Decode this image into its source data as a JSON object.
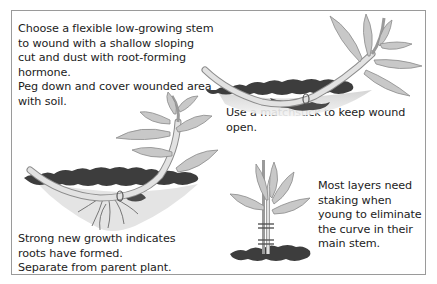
{
  "figure": {
    "steps": [
      {
        "id": "step-1",
        "lines": [
          "Choose a flexible low-growing stem",
          "to wound with a shallow sloping",
          "cut and dust with root-forming",
          "hormone.",
          "Peg down and cover wounded area",
          "with soil."
        ],
        "illustration": "stem-pegged-in-soil"
      },
      {
        "id": "step-2",
        "lines": [
          "Use a matchstick to keep wound",
          "open."
        ],
        "illustration": "wounded-stem-with-matchstick"
      },
      {
        "id": "step-3",
        "lines": [
          "Strong new growth indicates",
          "roots have formed.",
          "Separate from parent plant."
        ],
        "illustration": "rooted-layer-with-new-growth"
      },
      {
        "id": "step-4",
        "lines": [
          "Most layers need",
          "staking when",
          "young to eliminate",
          "the curve in their",
          "main stem."
        ],
        "illustration": "staked-young-plant"
      }
    ],
    "colors": {
      "border": "#9a9a9a",
      "text": "#1c1c1c",
      "leaf_fill": "#c9c9c9",
      "leaf_stroke": "#8a8a8a",
      "stem_fill": "#dcdcdc",
      "soil_dark": "#3a3a3a",
      "soil_light": "#bdbdbd"
    }
  }
}
